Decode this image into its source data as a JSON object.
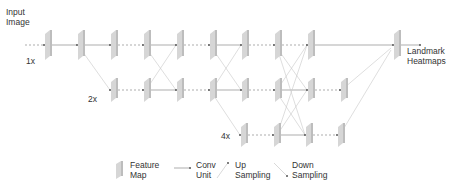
{
  "labels": {
    "input": "Input\nImage",
    "output": "Landmark\nHeatmaps",
    "scale_1x": "1x",
    "scale_2x": "2x",
    "scale_4x": "4x"
  },
  "legend": {
    "feature_map": "Feature\nMap",
    "conv_unit": "Conv\nUnit",
    "up_sampling": "Up\nSampling",
    "down_sampling": "Down\nSampling"
  },
  "colors": {
    "map_front": "#d6d6d6",
    "map_side": "#bdbdbd",
    "line": "#8a8a8a",
    "light_line": "#c8c8c8",
    "text": "#333333"
  },
  "graph": {
    "rows": [
      {
        "scale": "1x",
        "y": 45,
        "nodes": [
          44,
          77,
          110,
          143,
          176,
          209,
          241,
          274,
          307
        ]
      },
      {
        "scale": "2x",
        "y": 90,
        "nodes": [
          110,
          143,
          176,
          209,
          241,
          274,
          307,
          340
        ]
      },
      {
        "scale": "4x",
        "y": 135,
        "nodes": [
          240,
          273,
          305,
          337
        ]
      }
    ],
    "output_node": {
      "x": 393,
      "y": 45
    }
  }
}
